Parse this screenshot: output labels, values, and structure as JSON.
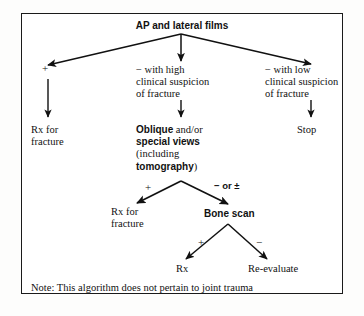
{
  "diagram": {
    "title": "AP and lateral films",
    "note": "Note: This algorithm does not pertain to joint trauma",
    "colors": {
      "ink": "#111111",
      "border": "#1a1a1a",
      "background": "#ffffff"
    },
    "nodes": {
      "root": "AP and lateral films",
      "branch_high_line1": "− with high",
      "branch_high_line2": "clinical suspicion",
      "branch_high_line3": "of fracture",
      "branch_low_line1": "− with low",
      "branch_low_line2": "clinical suspicion",
      "branch_low_line3": "of fracture",
      "rx_fracture_line1": "Rx for",
      "rx_fracture_line2": "fracture",
      "stop": "Stop",
      "oblique_bold1": "Oblique",
      "oblique_mid1": " and/or",
      "oblique_bold2": "special views",
      "oblique_paren_open": "(including",
      "oblique_bold3": "tomography",
      "oblique_paren_close": ")",
      "rx_fracture2_line1": "Rx for",
      "rx_fracture2_line2": "fracture",
      "bone_scan": "Bone scan",
      "rx": "Rx",
      "re_evaluate": "Re-evaluate"
    },
    "edge_labels": {
      "root_positive": "+",
      "second_positive": "+",
      "second_negative": "− or ±",
      "bone_positive": "+",
      "bone_negative": "−"
    }
  }
}
